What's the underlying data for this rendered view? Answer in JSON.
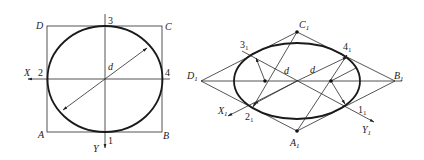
{
  "figure_left": {
    "title": "Circle in square (front view)",
    "corners": {
      "A": "A",
      "B": "B",
      "C": "C",
      "D": "D"
    },
    "points": {
      "p1": "1",
      "p2": "2",
      "p3": "3",
      "p4": "4"
    },
    "axes": {
      "x": "X",
      "y": "Y"
    },
    "diameter_label": "d"
  },
  "figure_right": {
    "title": "Isometric ellipse via four-center method",
    "corners": {
      "A": "A",
      "B": "B",
      "C": "C",
      "D": "D",
      "sub": "1"
    },
    "points": {
      "p1": "1",
      "p2": "2",
      "p3": "3",
      "p4": "4",
      "sub": "1"
    },
    "axes": {
      "x": "X",
      "y": "Y",
      "sub": "1"
    },
    "diameter_label": "d"
  }
}
